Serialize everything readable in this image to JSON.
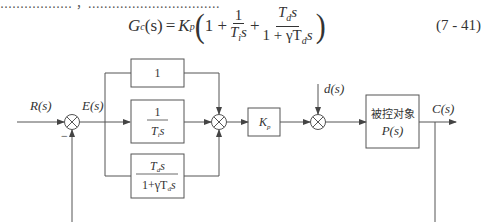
{
  "intro_text": "……………… ，……………………………",
  "equation": {
    "lhs": "G",
    "lhs_sub": "c",
    "lhs_arg": "(s)",
    "equals": "=",
    "gain": "K",
    "gain_sub": "p",
    "term1": "1 +",
    "frac1_num": "1",
    "frac1_den": "T",
    "frac1_den_sub": "i",
    "frac1_den_var": "s",
    "plus": "+",
    "frac2_num": "T",
    "frac2_num_sub": "d",
    "frac2_num_var": "s",
    "frac2_den": "1 + γT",
    "frac2_den_sub": "d",
    "frac2_den_var": "s",
    "number": "(7 - 41)"
  },
  "diagram": {
    "input_label": "R(s)",
    "error_label": "E(s)",
    "minus_sign": "−",
    "blocks": {
      "proportional": "1",
      "integral_num": "1",
      "integral_den": "T",
      "integral_den_sub": "i",
      "integral_den_var": "s",
      "derivative_num": "T",
      "derivative_num_sub": "d",
      "derivative_num_var": "s",
      "derivative_den": "1+γT",
      "derivative_den_sub": "d",
      "derivative_den_var": "s",
      "gain": "K",
      "gain_sub": "p",
      "plant_line1": "被控对象",
      "plant_line2": "P(s)"
    },
    "disturbance_label": "d(s)",
    "output_label": "C(s)"
  }
}
